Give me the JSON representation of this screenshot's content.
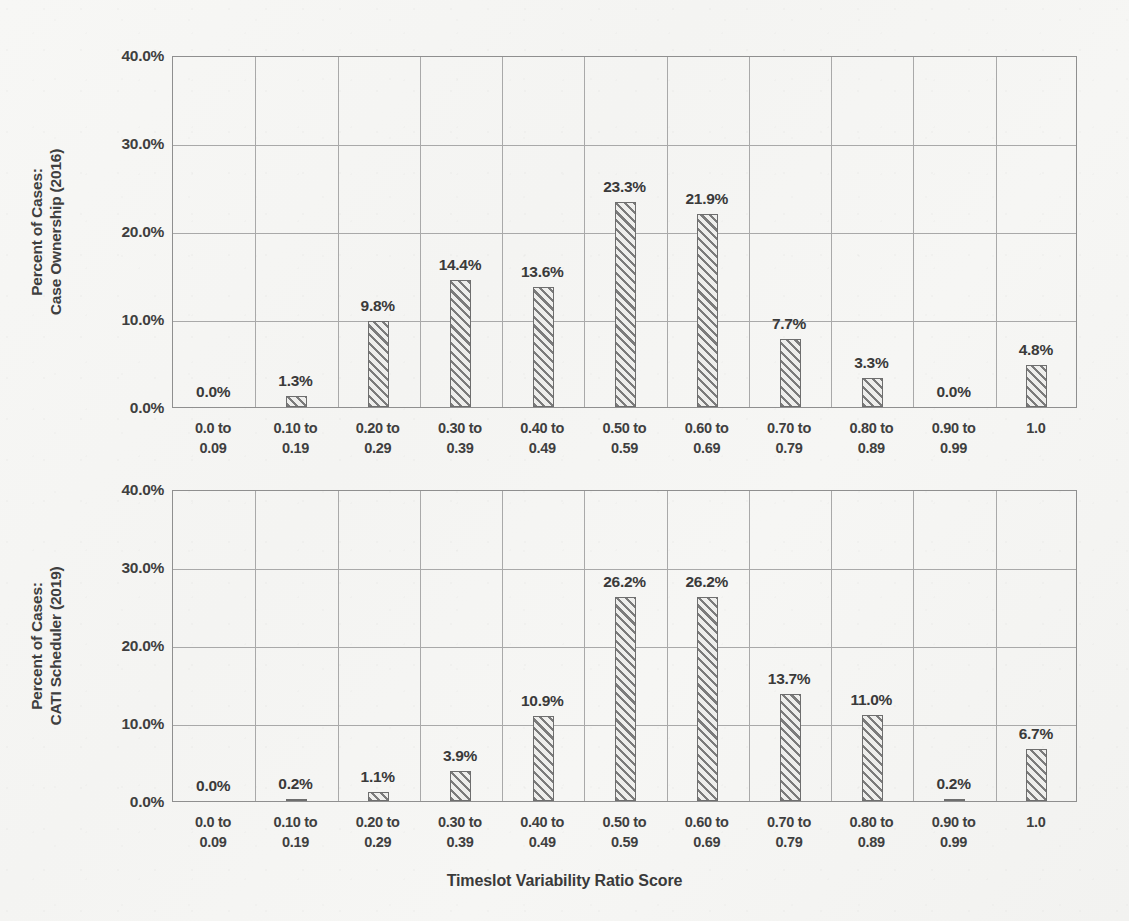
{
  "figure": {
    "xlabel": "Timeslot Variability Ratio Score"
  },
  "chart_data": [
    {
      "type": "bar",
      "title": "",
      "ylabel": "Percent of Cases:\nCase Ownership (2016)",
      "xlabel": "Timeslot Variability Ratio Score",
      "categories": [
        "0.0 to\n0.09",
        "0.10 to\n0.19",
        "0.20 to\n0.29",
        "0.30 to\n0.39",
        "0.40 to\n0.49",
        "0.50 to\n0.59",
        "0.60 to\n0.69",
        "0.70 to\n0.79",
        "0.80 to\n0.89",
        "0.90 to\n0.99",
        "1.0"
      ],
      "values": [
        0.0,
        1.3,
        9.8,
        14.4,
        13.6,
        23.3,
        21.9,
        7.7,
        3.3,
        0.0,
        4.8
      ],
      "data_labels": [
        "0.0%",
        "1.3%",
        "9.8%",
        "14.4%",
        "13.6%",
        "23.3%",
        "21.9%",
        "7.7%",
        "3.3%",
        "0.0%",
        "4.8%"
      ],
      "yticks": [
        0.0,
        10.0,
        20.0,
        30.0,
        40.0
      ],
      "ytick_labels": [
        "0.0%",
        "10.0%",
        "20.0%",
        "30.0%",
        "40.0%"
      ],
      "ylim": [
        0,
        40
      ],
      "grid": "horizontal-and-vertical",
      "legend": "none"
    },
    {
      "type": "bar",
      "title": "",
      "ylabel": "Percent of Cases:\nCATI Scheduler (2019)",
      "xlabel": "Timeslot Variability Ratio Score",
      "categories": [
        "0.0 to\n0.09",
        "0.10 to\n0.19",
        "0.20 to\n0.29",
        "0.30 to\n0.39",
        "0.40 to\n0.49",
        "0.50 to\n0.59",
        "0.60 to\n0.69",
        "0.70 to\n0.79",
        "0.80 to\n0.89",
        "0.90 to\n0.99",
        "1.0"
      ],
      "values": [
        0.0,
        0.2,
        1.1,
        3.9,
        10.9,
        26.2,
        26.2,
        13.7,
        11.0,
        0.2,
        6.7
      ],
      "data_labels": [
        "0.0%",
        "0.2%",
        "1.1%",
        "3.9%",
        "10.9%",
        "26.2%",
        "26.2%",
        "13.7%",
        "11.0%",
        "0.2%",
        "6.7%"
      ],
      "yticks": [
        0.0,
        10.0,
        20.0,
        30.0,
        40.0
      ],
      "ytick_labels": [
        "0.0%",
        "10.0%",
        "20.0%",
        "30.0%",
        "40.0%"
      ],
      "ylim": [
        0,
        40
      ],
      "grid": "horizontal-and-vertical",
      "legend": "none"
    }
  ],
  "colors": {
    "bar_hatch": "#7b7b7b",
    "bar_fill": "#eeeeec",
    "bar_edge": "#6e6e6e",
    "gridline": "#a9a9a9",
    "axis": "#8f8f8f",
    "text": "#3a3a3a",
    "page_background": "#f4f4f2"
  }
}
